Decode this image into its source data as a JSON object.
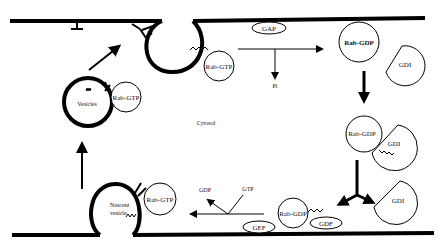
{
  "diagram": {
    "region_label": "Cytosol",
    "nodes": {
      "rab_gtp_top": "Rab-GTP",
      "rab_gtp_vesicle": "Rab-GTP",
      "rab_gtp_nascent": "Rab-GTP",
      "vesicles": "Vesicles",
      "nascent_vesicle_line1": "Nascent",
      "nascent_vesicle_line2": "vesicle",
      "gap": "GAP",
      "pi": "Pi",
      "rab_gdp_top": "Rab-GDP",
      "gdi_top": "GDI",
      "rab_gdp_complex": "Rab-GDP",
      "gdi_complex": "GDI",
      "gdi_free": "GDI",
      "rab_gdp_membrane": "Rab-GDP",
      "gdf": "GDF",
      "gef": "GEF",
      "gdp": "GDP",
      "gtp": "GTP"
    },
    "colors": {
      "ink": "#000000",
      "background": "#ffffff"
    }
  }
}
